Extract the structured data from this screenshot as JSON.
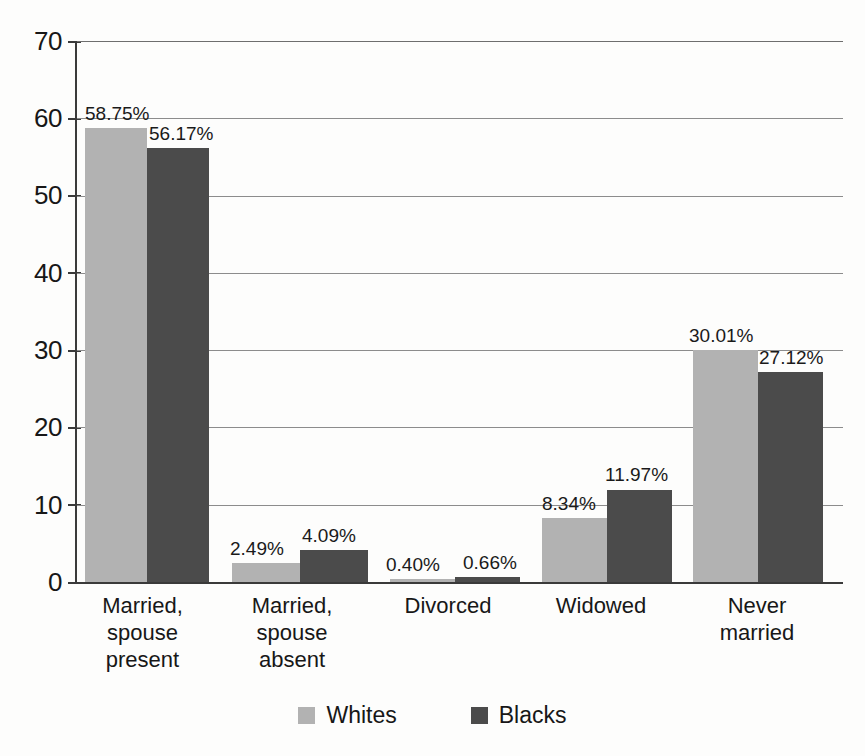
{
  "chart_data": {
    "type": "bar",
    "title": "",
    "subtitle": "",
    "xlabel": "",
    "ylabel": "",
    "ylim": [
      0,
      70
    ],
    "ytick_labels": [
      "70",
      "60",
      "50",
      "40",
      "30",
      "20",
      "10",
      "0"
    ],
    "ytick_values": [
      70,
      60,
      50,
      40,
      30,
      20,
      10,
      0
    ],
    "grid": "horizontal",
    "legend_position": "bottom-center",
    "categories": [
      "Married,\nspouse\npresent",
      "Married,\nspouse\nabsent",
      "Divorced",
      "Widowed",
      "Never\nmarried"
    ],
    "category_lines": [
      [
        "Married,",
        "spouse",
        "present"
      ],
      [
        "Married,",
        "spouse",
        "absent"
      ],
      [
        "Divorced"
      ],
      [
        "Widowed"
      ],
      [
        "Never",
        "married"
      ]
    ],
    "series": [
      {
        "name": "Whites",
        "color": "#b2b2b2",
        "values": [
          58.75,
          2.49,
          0.4,
          8.34,
          30.01
        ],
        "labels": [
          "58.75%",
          "2.49%",
          "0.40%",
          "8.34%",
          "30.01%"
        ]
      },
      {
        "name": "Blacks",
        "color": "#4b4b4b",
        "values": [
          56.17,
          4.09,
          0.66,
          11.97,
          27.12
        ],
        "labels": [
          "56.17%",
          "4.09%",
          "0.66%",
          "11.97%",
          "27.12%"
        ]
      }
    ]
  },
  "legend": {
    "items": [
      {
        "label": "Whites",
        "color": "#b2b2b2"
      },
      {
        "label": "Blacks",
        "color": "#4b4b4b"
      }
    ]
  }
}
